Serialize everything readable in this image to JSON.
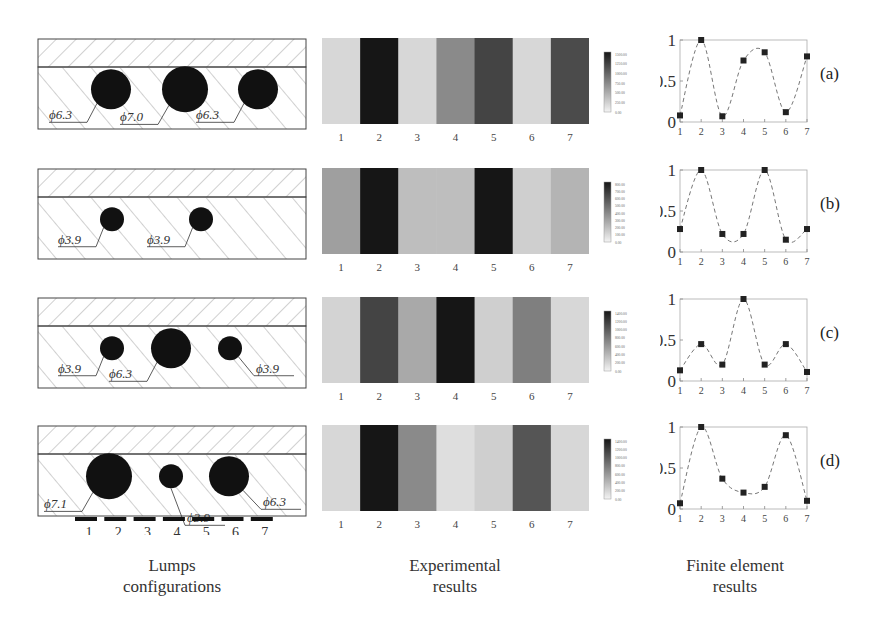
{
  "figure": {
    "column_titles": [
      {
        "line1": "Lumps",
        "line2": "configurations"
      },
      {
        "line1": "Experimental",
        "line2": "results"
      },
      {
        "line1": "Finite element",
        "line2": "results"
      }
    ],
    "sensor_labels": [
      "1",
      "2",
      "3",
      "4",
      "5",
      "6",
      "7"
    ],
    "rows": [
      {
        "id": "a",
        "label": "(a)",
        "lumps": [
          {
            "diameter": "ϕ6.3",
            "cx": 74,
            "r": 20,
            "label_side": "left"
          },
          {
            "diameter": "ϕ7.0",
            "cx": 148,
            "r": 23,
            "label_side": "left"
          },
          {
            "diameter": "ϕ6.3",
            "cx": 221,
            "r": 20,
            "label_side": "left"
          }
        ],
        "heat_gray": [
          0.08,
          1.0,
          0.08,
          0.45,
          0.78,
          0.08,
          0.75
        ],
        "colorbar_ticks": [
          "1500.00",
          "1250.00",
          "1000.00",
          "750.00",
          "500.00",
          "250.00",
          "0.00"
        ]
      },
      {
        "id": "b",
        "label": "(b)",
        "lumps": [
          {
            "diameter": "ϕ3.9",
            "cx": 75,
            "r": 12,
            "label_side": "left"
          },
          {
            "diameter": "ϕ3.9",
            "cx": 164,
            "r": 12,
            "label_side": "left"
          }
        ],
        "heat_gray": [
          0.35,
          1.0,
          0.2,
          0.2,
          1.0,
          0.12,
          0.25
        ],
        "colorbar_ticks": [
          "800.00",
          "700.00",
          "600.00",
          "500.00",
          "400.00",
          "300.00",
          "200.00",
          "100.00",
          "0.00"
        ]
      },
      {
        "id": "c",
        "label": "(c)",
        "lumps": [
          {
            "diameter": "ϕ3.9",
            "cx": 75,
            "r": 12,
            "label_side": "left"
          },
          {
            "diameter": "ϕ6.3",
            "cx": 134,
            "r": 20,
            "label_side": "left"
          },
          {
            "diameter": "ϕ3.9",
            "cx": 193,
            "r": 12,
            "label_side": "right"
          }
        ],
        "heat_gray": [
          0.1,
          0.78,
          0.3,
          1.0,
          0.12,
          0.5,
          0.08
        ],
        "colorbar_ticks": [
          "1400.00",
          "1200.00",
          "1000.00",
          "800.00",
          "600.00",
          "400.00",
          "200.00",
          "0.00"
        ]
      },
      {
        "id": "d",
        "label": "(d)",
        "lumps": [
          {
            "diameter": "ϕ7.1",
            "cx": 72,
            "r": 23,
            "label_side": "left"
          },
          {
            "diameter": "ϕ3.9",
            "cx": 134,
            "r": 12,
            "label_side": "below"
          },
          {
            "diameter": "ϕ6.3",
            "cx": 192,
            "r": 20,
            "label_side": "right"
          }
        ],
        "heat_gray": [
          0.08,
          1.0,
          0.45,
          0.05,
          0.12,
          0.7,
          0.08
        ],
        "colorbar_ticks": [
          "1400.00",
          "1200.00",
          "1000.00",
          "800.00",
          "600.00",
          "400.00",
          "200.00",
          "0.00"
        ]
      }
    ]
  },
  "chart_data": [
    {
      "type": "line",
      "title": "(a) Finite element results",
      "x": [
        1,
        2,
        3,
        4,
        5,
        6,
        7
      ],
      "values": [
        0.08,
        1.0,
        0.07,
        0.75,
        0.85,
        0.12,
        0.8
      ],
      "xlabel": "",
      "ylabel": "",
      "yticks": [
        "0",
        "0.5",
        "1"
      ],
      "ylim": [
        0,
        1
      ],
      "grid": false,
      "style": "dashed line with square markers"
    },
    {
      "type": "line",
      "title": "(b) Finite element results",
      "x": [
        1,
        2,
        3,
        4,
        5,
        6,
        7
      ],
      "values": [
        0.28,
        1.0,
        0.22,
        0.22,
        1.0,
        0.15,
        0.28
      ],
      "yticks": [
        "0",
        "0.5",
        "1"
      ],
      "ylim": [
        0,
        1
      ],
      "grid": false
    },
    {
      "type": "line",
      "title": "(c) Finite element results",
      "x": [
        1,
        2,
        3,
        4,
        5,
        6,
        7
      ],
      "values": [
        0.13,
        0.45,
        0.2,
        1.0,
        0.2,
        0.45,
        0.11
      ],
      "yticks": [
        "0",
        "0.5",
        "1"
      ],
      "ylim": [
        0,
        1
      ],
      "grid": false
    },
    {
      "type": "line",
      "title": "(d) Finite element results",
      "x": [
        1,
        2,
        3,
        4,
        5,
        6,
        7
      ],
      "values": [
        0.07,
        1.0,
        0.37,
        0.2,
        0.27,
        0.9,
        0.1
      ],
      "yticks": [
        "0",
        "0.5",
        "1"
      ],
      "ylim": [
        0,
        1
      ],
      "grid": false
    },
    {
      "type": "heatmap",
      "title": "Experimental results (normalized darkness per sensor column)",
      "categories": [
        "1",
        "2",
        "3",
        "4",
        "5",
        "6",
        "7"
      ],
      "series": [
        {
          "name": "(a)",
          "values": [
            0.08,
            1.0,
            0.08,
            0.45,
            0.78,
            0.08,
            0.75
          ]
        },
        {
          "name": "(b)",
          "values": [
            0.35,
            1.0,
            0.2,
            0.2,
            1.0,
            0.12,
            0.25
          ]
        },
        {
          "name": "(c)",
          "values": [
            0.1,
            0.78,
            0.3,
            1.0,
            0.12,
            0.5,
            0.08
          ]
        },
        {
          "name": "(d)",
          "values": [
            0.08,
            1.0,
            0.45,
            0.05,
            0.12,
            0.7,
            0.08
          ]
        }
      ]
    }
  ]
}
